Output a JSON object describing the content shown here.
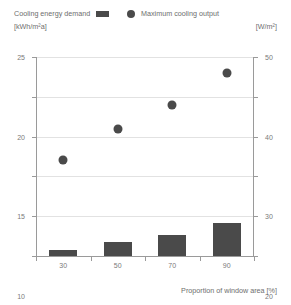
{
  "legend": {
    "left": {
      "label": "Cooling energy demand",
      "unit": "[kWh/m²a]",
      "swatch": "bar-swatch-icon"
    },
    "right": {
      "label": "Maximum cooling output",
      "unit": "[W/m²]",
      "swatch": "dot-swatch-icon"
    }
  },
  "colors": {
    "mark": "#4a4a4a",
    "axis": "#9a9a9a",
    "grid": "#e2e2e2",
    "text": "#6e6e6e",
    "background": "#ffffff"
  },
  "axes": {
    "left_ticks": [
      "0",
      "5",
      "10",
      "15",
      "20",
      "25"
    ],
    "right_ticks": [
      "0",
      "10",
      "20",
      "30",
      "40",
      "50"
    ],
    "x_ticks": [
      "30",
      "50",
      "70",
      "90"
    ],
    "x_title": "Proportion of window area [%]"
  },
  "chart_data": {
    "type": "bar",
    "title": "",
    "subtitle": "",
    "categories": [
      "30",
      "50",
      "70",
      "90"
    ],
    "x": [
      30,
      50,
      70,
      90
    ],
    "xlabel": "Proportion of window area [%]",
    "grid": true,
    "legend_position": "top",
    "series": [
      {
        "name": "Cooling energy demand",
        "type": "bar",
        "unit": "kWh/m²a",
        "axis": "left",
        "values": [
          0.8,
          1.8,
          2.7,
          4.1
        ]
      },
      {
        "name": "Maximum cooling output",
        "type": "scatter",
        "unit": "W/m²",
        "axis": "right",
        "values": [
          24,
          32,
          38,
          46
        ]
      }
    ],
    "ylabel": "Cooling energy demand [kWh/m²a]",
    "ylim": [
      0,
      25
    ],
    "y2label": "Maximum cooling output [W/m²]",
    "y2lim": [
      0,
      50
    ],
    "yticks": [
      0,
      5,
      10,
      15,
      20,
      25
    ],
    "y2ticks": [
      0,
      10,
      20,
      30,
      40,
      50
    ]
  }
}
